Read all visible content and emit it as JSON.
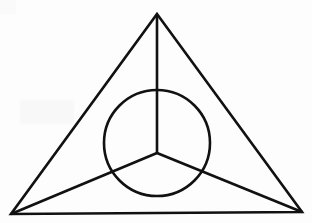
{
  "figure": {
    "background_color": "#fdfdfd",
    "stroke_color": "#111111",
    "stroke_width": 2.6,
    "canvas": {
      "width": 312,
      "height": 223
    },
    "elements": {
      "outer_triangle": {
        "label": "outer-triangle",
        "points": "157,14 302,212 11,214",
        "vertices": {
          "apex": {
            "x": 157,
            "y": 14
          },
          "bottom_right": {
            "x": 302,
            "y": 212
          },
          "bottom_left": {
            "x": 11,
            "y": 214
          }
        }
      },
      "circle": {
        "label": "inscribed-circle",
        "center": {
          "x": 157,
          "y": 143
        },
        "radius": 53
      },
      "hub": {
        "label": "spoke-hub",
        "x": 157,
        "y": 153
      },
      "spokes": [
        {
          "label": "spoke-up",
          "x1": 157,
          "y1": 153,
          "x2": 157,
          "y2": 14
        },
        {
          "label": "spoke-down-left",
          "x1": 157,
          "y1": 153,
          "x2": 11,
          "y2": 214
        },
        {
          "label": "spoke-down-right",
          "x1": 157,
          "y1": 153,
          "x2": 302,
          "y2": 212
        }
      ]
    },
    "artifacts": {
      "faint_smudge_label": "faint-scan-smudge",
      "corner_shade_label": "corner-scan-shade"
    }
  }
}
